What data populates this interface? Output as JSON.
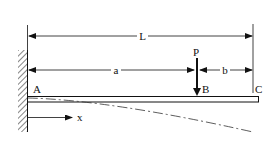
{
  "diagram": {
    "labels": {
      "length_total": "L",
      "length_a": "a",
      "length_b": "b",
      "load": "P",
      "point_a": "A",
      "point_b": "B",
      "point_c": "C",
      "axis_x": "x"
    },
    "colors": {
      "line": "#111111",
      "background": "#ffffff"
    }
  }
}
